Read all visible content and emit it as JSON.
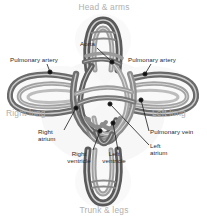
{
  "diagram": {
    "background_color": "#ffffff",
    "region_label_color": "#b0b0b0",
    "callout_label_color": "#2b2b2b",
    "vessel_colors": {
      "dark_tube": "#595959",
      "mid_tube": "#7d7d7d",
      "light_tube": "#a8a8a8",
      "highlight": "#ffffff",
      "shadow": "#cfcfcf"
    },
    "region_labels": [
      {
        "id": "head-arms",
        "text": "Head & arms",
        "x": 70,
        "y": 4,
        "align": "center",
        "width": 68
      },
      {
        "id": "right-lung",
        "text": "Right lung",
        "x": 6,
        "y": 110,
        "align": "left",
        "width": 60
      },
      {
        "id": "left-lung",
        "text": "Left lung",
        "x": 152,
        "y": 110,
        "align": "left",
        "width": 56
      },
      {
        "id": "trunk-legs",
        "text": "Trunk & legs",
        "x": 70,
        "y": 207,
        "align": "center",
        "width": 68
      }
    ],
    "callouts": [
      {
        "id": "pulmonary-artery-left",
        "text": "Pulmonary artery",
        "label_x": 10,
        "label_y": 56,
        "text_align": "left",
        "leader": [
          [
            47,
            64
          ],
          [
            50,
            72
          ]
        ],
        "dot": [
          50,
          72
        ]
      },
      {
        "id": "aorta",
        "text": "Aorta",
        "label_x": 80,
        "label_y": 40,
        "text_align": "left",
        "leader": [
          [
            97,
            48
          ],
          [
            112,
            62
          ]
        ],
        "dot": [
          112,
          62
        ]
      },
      {
        "id": "pulmonary-artery-right",
        "text": "Pulmonary artery",
        "label_x": 128,
        "label_y": 56,
        "text_align": "left",
        "leader": [
          [
            151,
            64
          ],
          [
            145,
            74
          ]
        ],
        "dot": [
          145,
          74
        ]
      },
      {
        "id": "right-atrium",
        "text": "Right\natrium",
        "label_x": 38,
        "label_y": 128,
        "text_align": "left",
        "leader": [
          [
            64,
            130
          ],
          [
            76,
            108
          ]
        ],
        "dot": [
          76,
          108
        ]
      },
      {
        "id": "pulmonary-vein",
        "text": "Pulmonary vein",
        "label_x": 150,
        "label_y": 128,
        "text_align": "left",
        "leader": [
          [
            149,
            131
          ],
          [
            141,
            100
          ]
        ],
        "dot": [
          141,
          100
        ]
      },
      {
        "id": "left-atrium",
        "text": "Left\natrium",
        "label_x": 150,
        "label_y": 142,
        "text_align": "left",
        "leader": [
          [
            149,
            145
          ],
          [
            110,
            104
          ]
        ],
        "dot": [
          110,
          104
        ]
      },
      {
        "id": "right-ventricle",
        "text": "Right\nventricle",
        "label_x": 78,
        "label_y": 150,
        "text_align": "center",
        "leader": [
          [
            93,
            150
          ],
          [
            100,
            131
          ]
        ],
        "dot": [
          100,
          131
        ]
      },
      {
        "id": "left-ventricle",
        "text": "Left\nventricle",
        "label_x": 108,
        "label_y": 150,
        "text_align": "center",
        "leader": [
          [
            118,
            150
          ],
          [
            113,
            123
          ]
        ],
        "dot": [
          113,
          123
        ]
      }
    ]
  },
  "chart_data": {
    "type": "diagram",
    "nodes": [
      "Head & arms",
      "Right lung",
      "Left lung",
      "Trunk & legs",
      "Aorta",
      "Pulmonary artery",
      "Pulmonary vein",
      "Right atrium",
      "Left atrium",
      "Right ventricle",
      "Left ventricle"
    ]
  }
}
